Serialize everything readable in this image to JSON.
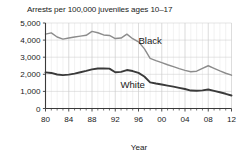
{
  "chart_data": {
    "type": "line",
    "title": "Arrests per 100,000 juveniles ages 10–17",
    "xlabel": "Year",
    "ylabel": "",
    "xlim": [
      1980,
      2012
    ],
    "ylim": [
      0,
      5000
    ],
    "grid": true,
    "legend_position": "inline-annotation",
    "y_ticks": [
      0,
      1000,
      2000,
      3000,
      4000,
      5000
    ],
    "y_tick_labels": [
      "0",
      "1,000",
      "2,000",
      "3,000",
      "4,000",
      "5,000"
    ],
    "x_ticks": [
      1980,
      1984,
      1988,
      1992,
      1996,
      2000,
      2004,
      2008,
      2012
    ],
    "x_tick_labels": [
      "80",
      "84",
      "88",
      "92",
      "96",
      "00",
      "04",
      "08",
      "12"
    ],
    "x": [
      1980,
      1981,
      1982,
      1983,
      1984,
      1985,
      1986,
      1987,
      1988,
      1989,
      1990,
      1991,
      1992,
      1993,
      1994,
      1995,
      1996,
      1997,
      1998,
      1999,
      2000,
      2001,
      2002,
      2003,
      2004,
      2005,
      2006,
      2007,
      2008,
      2009,
      2010,
      2011,
      2012
    ],
    "series": [
      {
        "name": "Black",
        "color": "#8c8c8c",
        "label_x": 1998,
        "label_y": 3750,
        "values": [
          4350,
          4420,
          4180,
          4060,
          4120,
          4180,
          4230,
          4280,
          4510,
          4430,
          4300,
          4270,
          4090,
          4120,
          4350,
          4080,
          3900,
          3500,
          2930,
          2800,
          2680,
          2560,
          2450,
          2330,
          2230,
          2150,
          2180,
          2340,
          2500,
          2350,
          2200,
          2060,
          1950
        ]
      },
      {
        "name": "White",
        "color": "#3a3a3a",
        "label_x": 1995,
        "label_y": 1180,
        "values": [
          2110,
          2080,
          1990,
          1950,
          1980,
          2040,
          2120,
          2200,
          2290,
          2340,
          2340,
          2330,
          2120,
          2140,
          2250,
          2190,
          2080,
          1870,
          1530,
          1460,
          1400,
          1340,
          1280,
          1210,
          1140,
          1050,
          1040,
          1060,
          1110,
          1030,
          950,
          860,
          760
        ]
      }
    ]
  }
}
